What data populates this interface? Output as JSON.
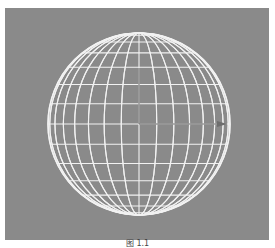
{
  "viewport": {
    "background": "#8a8a8a",
    "wire_color": "#f2f2f2",
    "axis_color": "#6e6e6e"
  },
  "sphere": {
    "type": "wireframe-sphere",
    "center": [
      134,
      116
    ],
    "radius": 91,
    "latitude_segments": 14,
    "longitude_segments": 32
  },
  "axis_gizmo": {
    "origin": [
      134,
      116
    ],
    "x_end": [
      222,
      116
    ],
    "y_end": [
      134,
      60
    ]
  },
  "caption": {
    "text": "图 1.1"
  }
}
